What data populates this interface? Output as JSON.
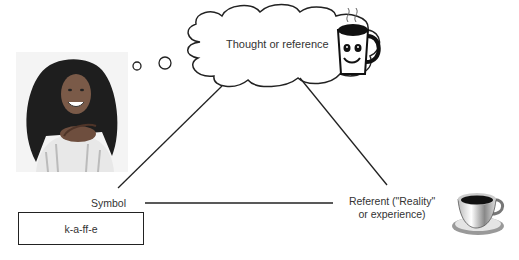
{
  "diagram": {
    "type": "semiotic-triangle",
    "nodes": {
      "thought": {
        "label": "Thought or reference",
        "icon": "smiling-coffee-mug-icon"
      },
      "symbol": {
        "label": "Symbol",
        "word": "k-a-ff-e"
      },
      "referent": {
        "label_line1": "Referent (\"Reality\"",
        "label_line2": "or experience)",
        "icon": "coffee-cup-icon"
      }
    },
    "person": {
      "description": "smiling woman thinking",
      "image": "woman-photo"
    },
    "edges": [
      {
        "from": "symbol",
        "to": "thought",
        "style": "solid"
      },
      {
        "from": "thought",
        "to": "referent",
        "style": "solid"
      },
      {
        "from": "symbol",
        "to": "referent",
        "style": "solid"
      }
    ],
    "colors": {
      "line": "#222222",
      "background": "#ffffff"
    }
  }
}
